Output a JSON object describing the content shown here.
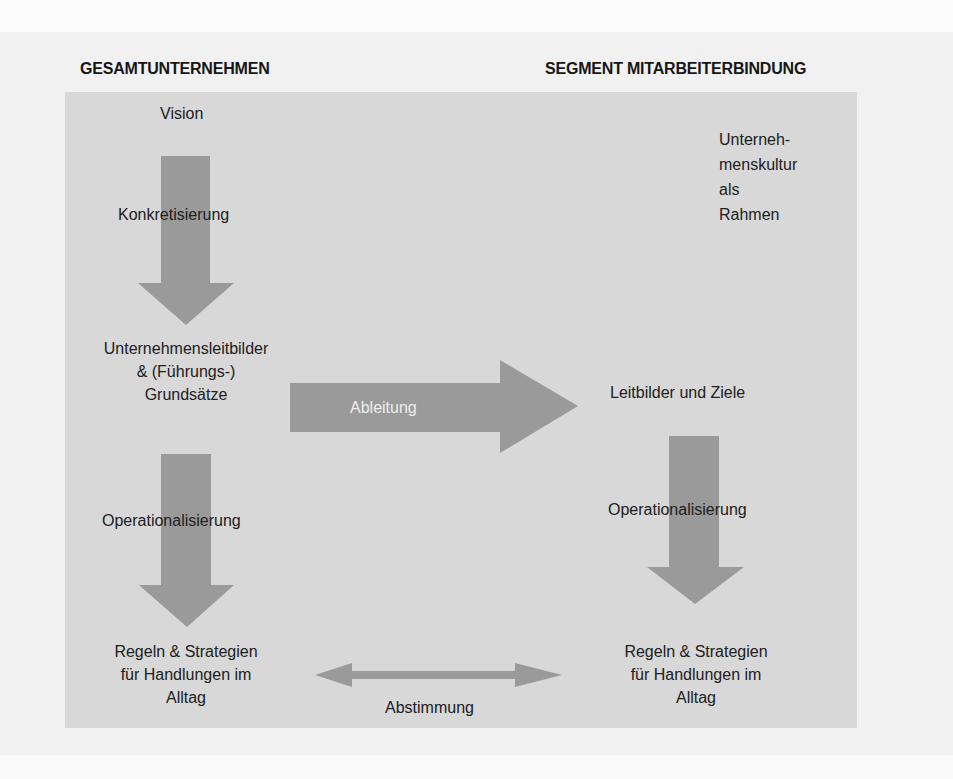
{
  "diagram": {
    "colors": {
      "page_background": "#f1f1f1",
      "panel_background": "#d8d8d8",
      "arrow_fill": "#9a9a9a",
      "text": "#1e1e1e",
      "arrow_label_text": "#eeeeee"
    },
    "left_column": {
      "heading": "GESAMTUNTERNEHMEN",
      "nodes": {
        "vision": "Vision",
        "leitbilder_line1": "Unternehmensleitbilder",
        "leitbilder_line2": "& (Führungs-)",
        "leitbilder_line3": "Grundsätze",
        "regeln_line1": "Regeln & Strategien",
        "regeln_line2": "für Handlungen im",
        "regeln_line3": "Alltag"
      },
      "arrows": {
        "first_down": "Konkretisierung",
        "second_down": "Operationalisierung"
      }
    },
    "right_column": {
      "heading": "SEGMENT MITARBEITERBINDUNG",
      "nodes": {
        "kultur_line1": "Unterneh-",
        "kultur_line2": "menskultur",
        "kultur_line3": "als",
        "kultur_line4": "Rahmen",
        "leitbilder_ziele": "Leitbilder und Ziele",
        "regeln_line1": "Regeln & Strategien",
        "regeln_line2": "für Handlungen im",
        "regeln_line3": "Alltag"
      },
      "arrows": {
        "down": "Operationalisierung"
      }
    },
    "cross_arrows": {
      "right": "Ableitung",
      "bidirectional": "Abstimmung"
    }
  }
}
